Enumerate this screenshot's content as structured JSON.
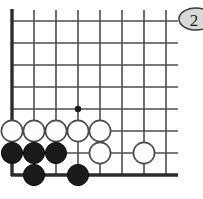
{
  "figure": {
    "type": "go-board-diagram",
    "width": 203,
    "height": 199,
    "background_color": "#ffffff"
  },
  "board": {
    "columns": 8,
    "rows": 8,
    "origin_x": 12,
    "origin_y": 21,
    "spacing": 22,
    "line_color": "#4d4d52",
    "edge_color": "#2b2b30",
    "left_edge": true,
    "bottom_edge": true,
    "top_edge": false,
    "right_edge": false,
    "line_overhang_right": 9,
    "bottom_edge_y": 175,
    "bottom_edge_x_end": 178
  },
  "star_points": [
    {
      "col": 3,
      "row": 4,
      "x": 78,
      "y": 109,
      "radius": 3.2
    }
  ],
  "stones": [
    {
      "color": "white",
      "col": 0,
      "row": 5,
      "x": 12,
      "y": 131
    },
    {
      "color": "white",
      "col": 1,
      "row": 5,
      "x": 34,
      "y": 131
    },
    {
      "color": "white",
      "col": 2,
      "row": 5,
      "x": 56,
      "y": 131
    },
    {
      "color": "white",
      "col": 3,
      "row": 5,
      "x": 78,
      "y": 131
    },
    {
      "color": "white",
      "col": 4,
      "row": 5,
      "x": 100,
      "y": 131
    },
    {
      "color": "black",
      "col": 0,
      "row": 6,
      "x": 12,
      "y": 153
    },
    {
      "color": "black",
      "col": 1,
      "row": 6,
      "x": 34,
      "y": 153
    },
    {
      "color": "black",
      "col": 2,
      "row": 6,
      "x": 56,
      "y": 153
    },
    {
      "color": "white",
      "col": 4,
      "row": 6,
      "x": 100,
      "y": 153
    },
    {
      "color": "white",
      "col": 6,
      "row": 6,
      "x": 144,
      "y": 153
    },
    {
      "color": "black",
      "col": 1,
      "row": 7,
      "x": 34,
      "y": 175
    },
    {
      "color": "black",
      "col": 3,
      "row": 7,
      "x": 78,
      "y": 175
    }
  ],
  "stone_style": {
    "radius": 10.6,
    "black_fill": "#1a1a1a",
    "black_stroke": "#0d0d0d",
    "white_fill": "#fdfdfd",
    "white_stroke": "#4b4b50"
  },
  "move_badge": {
    "label": "2",
    "cx": 196,
    "cy": 19,
    "rx": 17,
    "ry": 11,
    "fill": "#d9d9d9",
    "stroke": "#3a3a3a",
    "text_color": "#1c1c1c",
    "clipped_right": true
  }
}
